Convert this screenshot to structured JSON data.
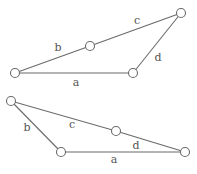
{
  "figures": [
    {
      "id": "top-quadrilateral",
      "nodes": [
        "n1",
        "n2",
        "n3",
        "n4"
      ],
      "edges": [
        {
          "label": "a",
          "from": "n1",
          "to": "n4"
        },
        {
          "label": "b",
          "from": "n1",
          "to": "n2"
        },
        {
          "label": "c",
          "from": "n2",
          "to": "n3"
        },
        {
          "label": "d",
          "from": "n3",
          "to": "n4"
        }
      ]
    },
    {
      "id": "bottom-quadrilateral",
      "nodes": [
        "n1",
        "n2",
        "n3",
        "n4"
      ],
      "edges": [
        {
          "label": "a",
          "from": "n2",
          "to": "n4"
        },
        {
          "label": "b",
          "from": "n1",
          "to": "n2"
        },
        {
          "label": "c",
          "from": "n1",
          "to": "n3"
        },
        {
          "label": "d",
          "from": "n3",
          "to": "n4"
        }
      ]
    }
  ],
  "labels": {
    "top": {
      "a": "a",
      "b": "b",
      "c": "c",
      "d": "d"
    },
    "bottom": {
      "a": "a",
      "b": "b",
      "c": "c",
      "d": "d"
    }
  },
  "colors": {
    "stroke": "#6a6a6a",
    "text": "#555555",
    "background": "#ffffff"
  }
}
